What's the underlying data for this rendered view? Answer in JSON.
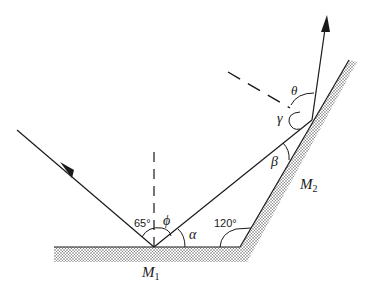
{
  "diagram": {
    "type": "two-mirror reflection ray diagram",
    "colors": {
      "line": "#1a1a1a",
      "hatch": "#555555",
      "background": "#ffffff"
    },
    "mirrors": [
      {
        "id": "M1",
        "label": "M",
        "subscript": "1",
        "orientation": "horizontal"
      },
      {
        "id": "M2",
        "label": "M",
        "subscript": "2",
        "orientation": "inclined"
      }
    ],
    "angles": {
      "incidence_on_M1": "65°",
      "between_mirrors": "120°",
      "phi": "ϕ",
      "alpha": "α",
      "beta": "β",
      "gamma": "γ",
      "theta": "θ"
    },
    "rays": [
      {
        "id": "incident",
        "from": "upper-left",
        "to": "M1",
        "arrow": "midpoint"
      },
      {
        "id": "reflected-1",
        "from": "M1",
        "to": "M2",
        "arrow": "none"
      },
      {
        "id": "reflected-2",
        "from": "M2",
        "to": "upward",
        "arrow": "end"
      }
    ],
    "normals": [
      {
        "id": "normal-M1",
        "style": "dashed",
        "at": "M1"
      },
      {
        "id": "normal-M2",
        "style": "dashed",
        "at": "M2"
      }
    ]
  }
}
